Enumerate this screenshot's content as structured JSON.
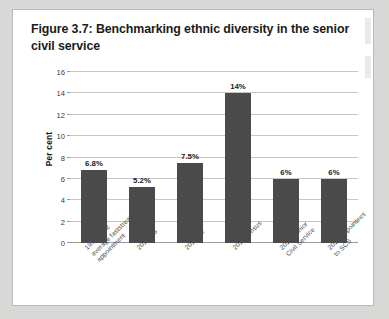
{
  "figure": {
    "title": "Figure 3.7: Benchmarking ethnic diversity in the senior civil service"
  },
  "chart_data": {
    "type": "bar",
    "title": "Figure 3.7: Benchmarking ethnic diversity in the senior civil service",
    "xlabel": "",
    "ylabel": "Per cent",
    "ylim": [
      0,
      16
    ],
    "yticks": [
      0,
      2,
      4,
      6,
      8,
      10,
      12,
      14,
      16
    ],
    "ytick_labels": [
      "0",
      "2",
      "4",
      "6",
      "8",
      "10",
      "12",
      "14",
      "16"
    ],
    "grid": true,
    "legend": false,
    "bar_color": "#4a4a4a",
    "categories": [
      "1998-2002 average faststream appointment",
      "2010 G6",
      "2010 G7",
      "2011 census",
      "2019 Senior Civil Service",
      "2019 Appointees to SCS"
    ],
    "values": [
      6.8,
      5.2,
      7.5,
      14,
      6,
      6
    ],
    "data_labels": [
      "6.8%",
      "5.2%",
      "7.5%",
      "14%",
      "6%",
      "6%"
    ]
  }
}
